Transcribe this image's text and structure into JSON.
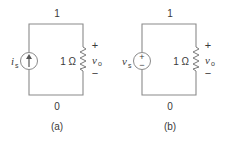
{
  "figure": {
    "circuits": [
      {
        "id": "a",
        "caption": "(a)",
        "top_node": "1",
        "bottom_node": "0",
        "source": {
          "type": "current-source",
          "symbol": "i",
          "subscript": "s"
        },
        "resistor_label": "1 Ω",
        "output": {
          "symbol": "v",
          "subscript": "o",
          "plus": "+",
          "minus": "−"
        }
      },
      {
        "id": "b",
        "caption": "(b)",
        "top_node": "1",
        "bottom_node": "0",
        "source": {
          "type": "voltage-source",
          "symbol": "v",
          "subscript": "s",
          "plus": "+",
          "minus": "−"
        },
        "resistor_label": "1 Ω",
        "output": {
          "symbol": "v",
          "subscript": "o",
          "plus": "+",
          "minus": "−"
        }
      }
    ],
    "colors": {
      "wire": "#8a8a8a",
      "text": "#3a3a3a",
      "background": "#ffffff"
    }
  }
}
